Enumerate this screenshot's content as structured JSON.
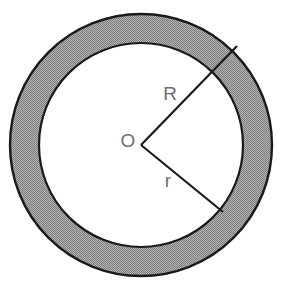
{
  "figure": {
    "name": "annulus-with-radii",
    "background_color": "#ffffff",
    "stroke_color": "#1a1a1a",
    "ring_fill_color": "#9a9a9a",
    "inner_fill_color": "#ffffff",
    "label_color": "#6e6e6e"
  },
  "geometry": {
    "center": {
      "x": 141,
      "y": 145,
      "label": "O"
    },
    "outer_circle": {
      "radius": 131,
      "stroke_width": 2.4
    },
    "inner_circle": {
      "radius": 102,
      "stroke_width": 2.2
    },
    "ring_width": 29,
    "sector": {
      "upper_radius_line": {
        "label": "R",
        "from": {
          "x": 141,
          "y": 145
        },
        "to": {
          "x": 237,
          "y": 46
        },
        "extends_to": "outer-circle",
        "angle_deg": -45.9
      },
      "lower_radius_line": {
        "label": "r",
        "from": {
          "x": 141,
          "y": 145
        },
        "to": {
          "x": 223,
          "y": 212
        },
        "extends_to": "inner-circle",
        "angle_deg": 39.3
      }
    }
  },
  "labels": {
    "outer_radius": {
      "text": "R",
      "x": 170,
      "y": 100,
      "font_size": 19
    },
    "center_point": {
      "text": "O",
      "x": 128,
      "y": 147,
      "font_size": 19
    },
    "inner_radius": {
      "text": "r",
      "x": 168,
      "y": 187,
      "font_size": 19
    }
  }
}
